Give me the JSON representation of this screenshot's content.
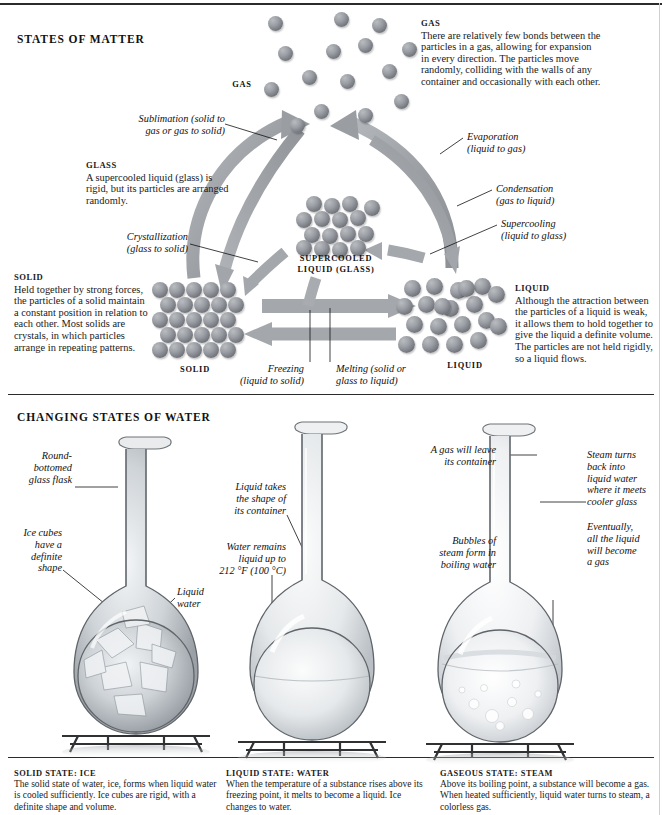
{
  "sections": {
    "matter_heading": "STATES OF MATTER",
    "water_heading": "CHANGING STATES OF WATER"
  },
  "matter_diagram": {
    "clusters": [
      {
        "id": "gas",
        "label": "GAS"
      },
      {
        "id": "supercooled",
        "label": "SUPERCOOLED\nLIQUID (GLASS)"
      },
      {
        "id": "solid",
        "label": "SOLID"
      },
      {
        "id": "liquid",
        "label": "LIQUID"
      }
    ],
    "cluster_labels": {
      "gas": "GAS",
      "supercooled_line1": "SUPERCOOLED",
      "supercooled_line2": "LIQUID (GLASS)",
      "solid": "SOLID",
      "liquid": "LIQUID"
    },
    "descriptions": [
      {
        "id": "gas",
        "title": "GAS",
        "body": "There are relatively few bonds between the particles in a gas, allowing for expansion in every direction. The particles move randomly, colliding with the walls of any container and occasionally with each other."
      },
      {
        "id": "glass",
        "title": "GLASS",
        "body": "A supercooled liquid (glass) is rigid, but its particles are arranged randomly."
      },
      {
        "id": "solid",
        "title": "SOLID",
        "body": "Held together by strong forces, the particles of a solid maintain a constant position in relation to each other. Most solids are crystals, in which particles arrange in repeating patterns."
      },
      {
        "id": "liquid",
        "title": "LIQUID",
        "body": "Although the attraction between the particles of a liquid is weak, it allows them to hold together to give the liquid a definite volume. The particles are not held rigidly, so a liquid flows."
      }
    ],
    "transitions": [
      {
        "id": "sublimation",
        "line1": "Sublimation (solid to",
        "line2": "gas or gas to solid)"
      },
      {
        "id": "evaporation",
        "line1": "Evaporation",
        "line2": "(liquid to gas)"
      },
      {
        "id": "condensation",
        "line1": "Condensation",
        "line2": "(gas to liquid)"
      },
      {
        "id": "supercooling",
        "line1": "Supercooling",
        "line2": "(liquid to glass)"
      },
      {
        "id": "crystallization",
        "line1": "Crystallization",
        "line2": "(glass to solid)"
      },
      {
        "id": "freezing",
        "line1": "Freezing",
        "line2": "(liquid to solid)"
      },
      {
        "id": "melting",
        "line1": "Melting (solid or",
        "line2": "glass to liquid)"
      }
    ]
  },
  "water_section": {
    "flasks": [
      {
        "id": "ice",
        "caption_title": "SOLID STATE: ICE",
        "caption_body": "The solid state of water, ice, forms when liquid water is cooled sufficiently. Ice cubes are rigid, with a definite shape and volume."
      },
      {
        "id": "water",
        "caption_title": "LIQUID STATE: WATER",
        "caption_body": "When the temperature of a substance rises above its freezing point, it melts to become a liquid. Ice changes to water."
      },
      {
        "id": "steam",
        "caption_title": "GASEOUS STATE: STEAM",
        "caption_body": "Above its boiling point, a substance will become a gas. When heated sufficiently, liquid water turns to steam, a colorless gas."
      }
    ],
    "annotations": [
      {
        "id": "round-bottomed-flask",
        "lines": [
          "Round-",
          "bottomed",
          "glass flask"
        ]
      },
      {
        "id": "ice-cubes-shape",
        "lines": [
          "Ice cubes",
          "have a",
          "definite",
          "shape"
        ]
      },
      {
        "id": "liquid-water",
        "lines": [
          "Liquid",
          "water"
        ]
      },
      {
        "id": "liquid-takes-shape",
        "lines": [
          "Liquid takes",
          "the shape of",
          "its container"
        ]
      },
      {
        "id": "water-remains-liquid",
        "lines": [
          "Water remains",
          "liquid up to",
          "212 °F (100 °C)"
        ]
      },
      {
        "id": "gas-will-leave",
        "lines": [
          "A gas will leave",
          "its container"
        ]
      },
      {
        "id": "bubbles-of-steam",
        "lines": [
          "Bubbles of",
          "steam form in",
          "boiling water"
        ]
      },
      {
        "id": "steam-turns-back",
        "lines": [
          "Steam turns",
          "back into",
          "liquid water",
          "where it meets",
          "cooler glass"
        ]
      },
      {
        "id": "eventually-all-gas",
        "lines": [
          "Eventually,",
          "all the liquid",
          "will become",
          "a gas"
        ]
      }
    ]
  },
  "colors": {
    "arrow_gray": "#9a9ea2",
    "particle_gray": "#7e8288",
    "rule_black": "#2b2b2b"
  }
}
